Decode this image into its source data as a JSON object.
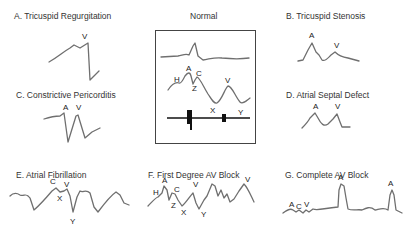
{
  "panels": {
    "a": {
      "title": "A. Tricuspid Regurgitation",
      "labels": [
        "V"
      ]
    },
    "normal": {
      "title": "Normal",
      "labels": [
        "H",
        "A",
        "C",
        "Z",
        "V",
        "X",
        "Y"
      ]
    },
    "b": {
      "title": "B. Tricuspid Stenosis",
      "labels": [
        "A",
        "V"
      ]
    },
    "c": {
      "title": "C. Constrictive Pericorditis",
      "labels": [
        "A",
        "V"
      ]
    },
    "d": {
      "title": "D. Atrial Septal Defect",
      "labels": [
        "A",
        "V"
      ]
    },
    "e": {
      "title": "E. Atrial Fibrillation",
      "labels": [
        "C",
        "V",
        "X",
        "Y"
      ]
    },
    "f": {
      "title": "F. First Degree AV Block",
      "labels": [
        "H",
        "A",
        "C",
        "V",
        "Z",
        "X",
        "Y",
        "V"
      ]
    },
    "g": {
      "title": "G. Complete AV Block",
      "labels": [
        "A",
        "C",
        "V",
        "A",
        "A"
      ]
    }
  },
  "colors": {
    "wave": "#6f6f6f",
    "box": "#444444",
    "text": "#222222"
  }
}
